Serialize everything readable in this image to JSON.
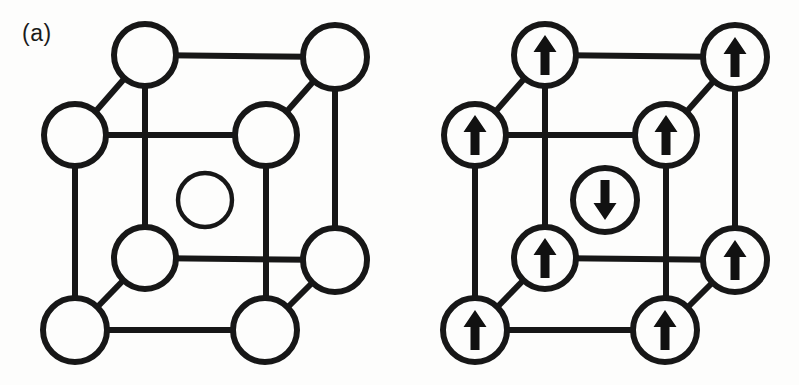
{
  "figure": {
    "background_color": "#fdfdfc",
    "line_color": "#171717",
    "atom_fill_color": "#fdfdfc",
    "spin_color": "#111111"
  },
  "panels": [
    {
      "id": "a",
      "label": "(a)",
      "structure": "body-centered cubic unit cell",
      "atom_count": 9,
      "corner_atom_count": 8,
      "body_center_atom_count": 1,
      "has_spins": false,
      "atoms": [
        {
          "name": "back-top-left",
          "cx": 145,
          "cy": 55,
          "r": 31,
          "spin": "none"
        },
        {
          "name": "back-top-right",
          "cx": 335,
          "cy": 57,
          "r": 32,
          "spin": "none"
        },
        {
          "name": "front-top-left",
          "cx": 75,
          "cy": 135,
          "r": 31,
          "spin": "none"
        },
        {
          "name": "front-top-right",
          "cx": 266,
          "cy": 135,
          "r": 31,
          "spin": "none"
        },
        {
          "name": "body-center",
          "cx": 205,
          "cy": 200,
          "r": 27,
          "spin": "none"
        },
        {
          "name": "front-bottom-left",
          "cx": 145,
          "cy": 258,
          "r": 31,
          "spin": "none"
        },
        {
          "name": "back-bottom-right",
          "cx": 335,
          "cy": 260,
          "r": 32,
          "spin": "none"
        },
        {
          "name": "front-base-left",
          "cx": 75,
          "cy": 330,
          "r": 32,
          "spin": "none"
        },
        {
          "name": "front-base-right",
          "cx": 265,
          "cy": 330,
          "r": 32,
          "spin": "none"
        }
      ]
    },
    {
      "id": "b",
      "label": "(b)",
      "structure": "body-centered cubic unit cell with magnetic moments",
      "atom_count": 9,
      "corner_atom_count": 8,
      "body_center_atom_count": 1,
      "has_spins": true,
      "spin_up_count": 8,
      "spin_down_count": 1,
      "magnetic_order": "antiferromagnetic",
      "atoms": [
        {
          "name": "back-top-left",
          "cx": 145,
          "cy": 55,
          "r": 31,
          "spin": "up"
        },
        {
          "name": "back-top-right",
          "cx": 335,
          "cy": 57,
          "r": 32,
          "spin": "up"
        },
        {
          "name": "front-top-left",
          "cx": 75,
          "cy": 135,
          "r": 31,
          "spin": "up"
        },
        {
          "name": "front-top-right",
          "cx": 266,
          "cy": 135,
          "r": 31,
          "spin": "up"
        },
        {
          "name": "body-center",
          "cx": 205,
          "cy": 200,
          "r": 32,
          "spin": "down"
        },
        {
          "name": "front-bottom-left",
          "cx": 145,
          "cy": 258,
          "r": 31,
          "spin": "up"
        },
        {
          "name": "back-bottom-right",
          "cx": 335,
          "cy": 260,
          "r": 32,
          "spin": "up"
        },
        {
          "name": "front-base-left",
          "cx": 75,
          "cy": 330,
          "r": 32,
          "spin": "up"
        },
        {
          "name": "front-base-right",
          "cx": 265,
          "cy": 330,
          "r": 32,
          "spin": "up"
        }
      ]
    }
  ],
  "bonds": [
    {
      "name": "back-top-edge",
      "x1": 145,
      "y1": 55,
      "x2": 335,
      "y2": 57
    },
    {
      "name": "back-left-vertical",
      "x1": 145,
      "y1": 55,
      "x2": 145,
      "y2": 258
    },
    {
      "name": "back-right-vertical",
      "x1": 335,
      "y1": 57,
      "x2": 335,
      "y2": 260
    },
    {
      "name": "back-bottom-edge",
      "x1": 145,
      "y1": 258,
      "x2": 335,
      "y2": 260
    },
    {
      "name": "front-top-edge",
      "x1": 75,
      "y1": 135,
      "x2": 266,
      "y2": 135
    },
    {
      "name": "front-left-vertical",
      "x1": 75,
      "y1": 135,
      "x2": 75,
      "y2": 330
    },
    {
      "name": "front-right-vertical",
      "x1": 266,
      "y1": 135,
      "x2": 266,
      "y2": 330
    },
    {
      "name": "front-bottom-edge",
      "x1": 75,
      "y1": 330,
      "x2": 265,
      "y2": 330
    },
    {
      "name": "depth-top-left",
      "x1": 75,
      "y1": 135,
      "x2": 145,
      "y2": 55
    },
    {
      "name": "depth-top-right",
      "x1": 266,
      "y1": 135,
      "x2": 335,
      "y2": 57
    },
    {
      "name": "depth-bottom-left",
      "x1": 75,
      "y1": 330,
      "x2": 145,
      "y2": 258
    },
    {
      "name": "depth-bottom-right",
      "x1": 265,
      "y1": 330,
      "x2": 335,
      "y2": 260
    }
  ]
}
